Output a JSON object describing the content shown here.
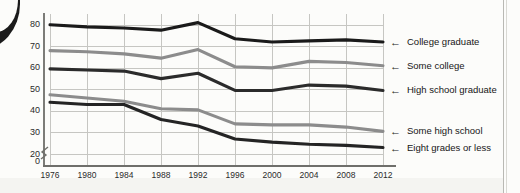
{
  "chart_data": {
    "type": "line",
    "title": "",
    "subtitle": "",
    "xlabel": "",
    "ylabel": "",
    "x": [
      1976,
      1980,
      1984,
      1988,
      1992,
      1996,
      2000,
      2004,
      2008,
      2012
    ],
    "xtick_labels": [
      "1976",
      "1980",
      "1984",
      "1988",
      "1992",
      "1996",
      "2000",
      "2004",
      "2008",
      "2012"
    ],
    "ytick_labels": [
      "0",
      "20",
      "30",
      "40",
      "50",
      "60",
      "70",
      "80"
    ],
    "ytick_values": [
      0,
      20,
      30,
      40,
      50,
      60,
      70,
      80
    ],
    "ylim": [
      20,
      85
    ],
    "axis_break": true,
    "axis_break_note": "y-axis broken between 0 and 20",
    "grid": true,
    "legend_position": "right-arrows",
    "series": [
      {
        "name": "College graduate",
        "color": "#1a1a1a",
        "values": [
          80,
          79,
          78.5,
          77.5,
          81,
          73.5,
          72,
          72.5,
          73,
          72
        ]
      },
      {
        "name": "Some college",
        "color": "#8c8c8c",
        "values": [
          68,
          67.5,
          66.5,
          64.5,
          68.5,
          60.5,
          60,
          63,
          62.5,
          61
        ]
      },
      {
        "name": "High school graduate",
        "color": "#2b2b2b",
        "values": [
          59.5,
          59,
          58.5,
          55,
          57.5,
          49.5,
          49.5,
          52,
          51.5,
          49.5
        ]
      },
      {
        "name": "Some high school",
        "color": "#8c8c8c",
        "values": [
          47.5,
          46,
          44.5,
          41,
          40.5,
          34,
          33.5,
          33.5,
          32.5,
          30.5
        ]
      },
      {
        "name": "Eight grades or less",
        "color": "#242424",
        "values": [
          44,
          43,
          43,
          36,
          33,
          27,
          25.5,
          24.5,
          24,
          23
        ]
      }
    ]
  },
  "legend": {
    "arrow_glyph": "←",
    "items": [
      {
        "label": "College graduate"
      },
      {
        "label": "Some college"
      },
      {
        "label": "High school graduate"
      },
      {
        "label": "Some high school"
      },
      {
        "label": "Eight grades or less"
      }
    ]
  }
}
